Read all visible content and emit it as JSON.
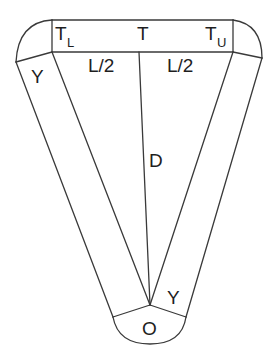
{
  "diagram": {
    "type": "geometric-schematic",
    "labels": {
      "top_center": "T",
      "top_left_main": "T",
      "top_left_sub": "L",
      "top_right_main": "T",
      "top_right_sub": "U",
      "left_half_length": "L/2",
      "right_half_length": "L/2",
      "center_distance": "D",
      "left_band": "Y",
      "right_band": "Y",
      "origin": "O"
    },
    "stroke_color": "#3a3a3a",
    "text_color": "#1e1e1e",
    "background": "#ffffff"
  }
}
